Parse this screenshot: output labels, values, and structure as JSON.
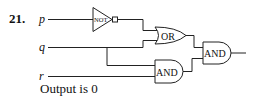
{
  "problem": {
    "number": "21.",
    "inputs": {
      "p": "p",
      "q": "q",
      "r": "r"
    },
    "gates": {
      "not": "NOT",
      "or": "OR",
      "and_lower": "AND",
      "and_output": "AND"
    },
    "result": "Output is 0"
  },
  "colors": {
    "stroke": "#222222",
    "background": "#ffffff"
  }
}
